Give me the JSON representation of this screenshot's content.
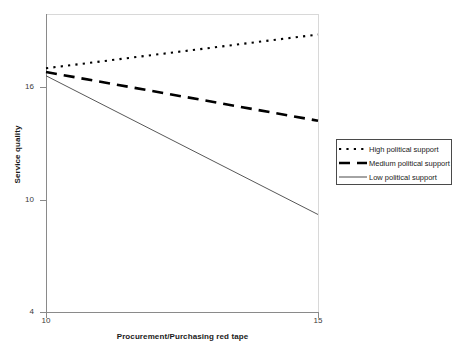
{
  "chart_data": {
    "type": "line",
    "title": "",
    "xlabel": "Procurement/Purchasing red tape",
    "ylabel": "Service quality",
    "xlim": [
      10,
      15
    ],
    "ylim": [
      4,
      19.3
    ],
    "xticks": [
      "10",
      "15"
    ],
    "xtick_values": [
      10,
      15
    ],
    "yticks": [
      "4",
      "10",
      "16"
    ],
    "ytick_values": [
      4,
      10,
      16
    ],
    "grid": false,
    "legend_position": "right",
    "x": [
      10,
      15
    ],
    "series": [
      {
        "name": "High political support",
        "style": "dotted",
        "color": "#000000",
        "values": [
          17.0,
          18.8
        ]
      },
      {
        "name": "Medium political support",
        "style": "dashed",
        "color": "#000000",
        "values": [
          16.8,
          14.2
        ]
      },
      {
        "name": "Low political support",
        "style": "solid",
        "color": "#444444",
        "values": [
          16.6,
          9.2
        ]
      }
    ]
  },
  "axes": {
    "y_label": "Service quality",
    "x_label": "Procurement/Purchasing red tape",
    "y_tick_16": "16",
    "y_tick_10": "10",
    "y_tick_4": "4",
    "x_tick_10": "10",
    "x_tick_15": "15"
  },
  "legend": {
    "items": [
      {
        "label": "High political support"
      },
      {
        "label": "Medium political support"
      },
      {
        "label": "Low political support"
      }
    ]
  }
}
